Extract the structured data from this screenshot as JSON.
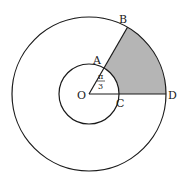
{
  "diagram": {
    "center": {
      "label": "O",
      "x": 89,
      "y": 94
    },
    "inner_radius": 30,
    "outer_radius": 77,
    "angle_label": {
      "numerator": "π",
      "denominator": "3"
    },
    "points": {
      "O": "O",
      "A": "A",
      "B": "B",
      "C": "C",
      "D": "D"
    },
    "colors": {
      "stroke": "#1a1a1a",
      "shade": "#b5b5b5",
      "background": "#ffffff"
    }
  }
}
